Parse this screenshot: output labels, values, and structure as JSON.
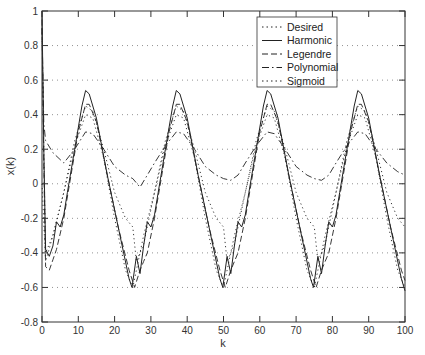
{
  "chart_data": {
    "type": "line",
    "title": "",
    "xlabel": "k",
    "ylabel": "x(k)",
    "xlim": [
      0,
      100
    ],
    "ylim": [
      -0.8,
      1
    ],
    "xticks": [
      0,
      10,
      20,
      30,
      40,
      50,
      60,
      70,
      80,
      90,
      100
    ],
    "yticks": [
      -0.8,
      -0.6,
      -0.4,
      -0.2,
      0,
      0.2,
      0.4,
      0.6,
      0.8,
      1
    ],
    "xtick_labels": [
      "0",
      "10",
      "20",
      "30",
      "40",
      "50",
      "60",
      "70",
      "80",
      "90",
      "100"
    ],
    "ytick_labels": [
      "-0.8",
      "-0.6",
      "-0.4",
      "-0.2",
      "0",
      "0.2",
      "0.4",
      "0.6",
      "0.8",
      "1"
    ],
    "grid": "horizontal dotted",
    "legend_position": "upper right",
    "legend": [
      "Desired",
      "Harmonic",
      "Legendre",
      "Polynomial",
      "Sigmoid"
    ],
    "period": 25,
    "series": [
      {
        "name": "Desired",
        "style": "dotted",
        "x": [
          0,
          1,
          3,
          6,
          9,
          12,
          14,
          17,
          20,
          23,
          25,
          26,
          28,
          31,
          34,
          37,
          39,
          42,
          45,
          48,
          50,
          51,
          53,
          56,
          59,
          62,
          64,
          67,
          70,
          73,
          75,
          76,
          78,
          81,
          84,
          87,
          89,
          92,
          95,
          98,
          100
        ],
        "values": [
          0.0,
          -0.45,
          -0.3,
          -0.05,
          0.22,
          0.4,
          0.38,
          0.15,
          -0.2,
          -0.5,
          -0.6,
          -0.5,
          -0.3,
          -0.05,
          0.22,
          0.4,
          0.38,
          0.15,
          -0.2,
          -0.5,
          -0.6,
          -0.5,
          -0.3,
          -0.05,
          0.22,
          0.4,
          0.38,
          0.15,
          -0.2,
          -0.5,
          -0.6,
          -0.5,
          -0.3,
          -0.05,
          0.22,
          0.4,
          0.38,
          0.15,
          -0.2,
          -0.5,
          -0.6
        ]
      },
      {
        "name": "Harmonic",
        "style": "solid",
        "x": [
          0,
          0.5,
          1,
          2,
          3,
          4,
          5,
          6,
          7,
          9,
          11,
          12,
          13,
          15,
          18,
          21,
          24,
          24.8,
          26,
          27,
          28,
          29,
          30,
          31,
          32,
          34,
          36,
          37,
          38,
          40,
          43,
          46,
          49,
          49.8,
          51,
          52,
          53,
          54,
          55,
          56,
          57,
          59,
          61,
          62,
          63,
          65,
          68,
          71,
          74,
          74.8,
          76,
          77,
          78,
          79,
          80,
          81,
          82,
          84,
          86,
          87,
          88,
          90,
          93,
          96,
          99,
          100
        ],
        "values": [
          1.0,
          0.2,
          -0.38,
          -0.42,
          -0.36,
          -0.22,
          -0.25,
          -0.18,
          -0.05,
          0.2,
          0.45,
          0.54,
          0.52,
          0.38,
          0.05,
          -0.25,
          -0.55,
          -0.6,
          -0.42,
          -0.52,
          -0.36,
          -0.22,
          -0.25,
          -0.18,
          -0.05,
          0.2,
          0.45,
          0.54,
          0.52,
          0.38,
          0.05,
          -0.25,
          -0.55,
          -0.6,
          -0.42,
          -0.52,
          -0.36,
          -0.22,
          -0.25,
          -0.18,
          -0.05,
          0.2,
          0.45,
          0.54,
          0.52,
          0.38,
          0.05,
          -0.25,
          -0.55,
          -0.6,
          -0.42,
          -0.52,
          -0.36,
          -0.22,
          -0.25,
          -0.18,
          -0.05,
          0.2,
          0.45,
          0.54,
          0.52,
          0.38,
          0.05,
          -0.25,
          -0.55,
          -0.62
        ]
      },
      {
        "name": "Legendre",
        "style": "dashed",
        "x": [
          0,
          0.5,
          1,
          2,
          3,
          4,
          6,
          8,
          10,
          12,
          13,
          15,
          18,
          21,
          24,
          25.5,
          27,
          28,
          29,
          31,
          33,
          35,
          37,
          38,
          40,
          43,
          46,
          49,
          50.5,
          52,
          53,
          54,
          56,
          58,
          60,
          62,
          63,
          65,
          68,
          71,
          74,
          75.5,
          77,
          78,
          79,
          81,
          83,
          85,
          87,
          88,
          90,
          93,
          96,
          99,
          100
        ],
        "values": [
          0.95,
          0.1,
          -0.48,
          -0.5,
          -0.44,
          -0.38,
          -0.2,
          0.05,
          0.3,
          0.46,
          0.46,
          0.36,
          0.05,
          -0.25,
          -0.5,
          -0.6,
          -0.5,
          -0.45,
          -0.4,
          -0.2,
          0.05,
          0.3,
          0.46,
          0.46,
          0.36,
          0.05,
          -0.25,
          -0.5,
          -0.6,
          -0.5,
          -0.45,
          -0.4,
          -0.2,
          0.05,
          0.3,
          0.46,
          0.46,
          0.36,
          0.05,
          -0.25,
          -0.5,
          -0.6,
          -0.5,
          -0.45,
          -0.4,
          -0.2,
          0.05,
          0.3,
          0.46,
          0.46,
          0.36,
          0.05,
          -0.25,
          -0.5,
          -0.56
        ]
      },
      {
        "name": "Polynomial",
        "style": "dash-dot",
        "x": [
          0,
          0.5,
          1,
          3,
          6,
          9,
          12,
          14,
          17,
          20,
          23,
          25,
          27,
          29,
          31,
          34,
          37,
          39,
          42,
          45,
          48,
          50,
          52,
          54,
          56,
          59,
          62,
          64,
          67,
          70,
          73,
          75,
          77,
          79,
          81,
          84,
          87,
          89,
          92,
          95,
          98,
          100
        ],
        "values": [
          0.9,
          0.35,
          0.25,
          0.18,
          0.12,
          0.2,
          0.3,
          0.29,
          0.2,
          0.1,
          0.05,
          0.03,
          -0.02,
          0.05,
          0.12,
          0.22,
          0.3,
          0.29,
          0.2,
          0.1,
          0.05,
          0.03,
          0.02,
          0.05,
          0.12,
          0.22,
          0.3,
          0.29,
          0.2,
          0.1,
          0.05,
          0.03,
          0.02,
          0.05,
          0.12,
          0.22,
          0.3,
          0.29,
          0.2,
          0.12,
          0.07,
          0.05
        ]
      },
      {
        "name": "Sigmoid",
        "style": "dotted",
        "x": [
          0,
          0.5,
          1,
          3,
          6,
          9,
          12,
          14,
          17,
          20,
          23,
          25,
          26,
          28,
          31,
          34,
          37,
          39,
          42,
          45,
          48,
          50,
          51,
          53,
          56,
          59,
          62,
          64,
          67,
          70,
          73,
          75,
          76,
          78,
          81,
          84,
          87,
          89,
          92,
          95,
          98,
          100
        ],
        "values": [
          0.9,
          0.2,
          -0.4,
          -0.3,
          -0.05,
          0.25,
          0.45,
          0.42,
          0.2,
          -0.05,
          -0.2,
          -0.25,
          -0.45,
          -0.35,
          -0.05,
          0.25,
          0.45,
          0.42,
          0.2,
          -0.05,
          -0.2,
          -0.25,
          -0.45,
          -0.35,
          -0.05,
          0.25,
          0.45,
          0.42,
          0.2,
          -0.05,
          -0.2,
          -0.25,
          -0.45,
          -0.35,
          -0.05,
          0.25,
          0.45,
          0.42,
          0.2,
          -0.05,
          -0.2,
          -0.25
        ]
      }
    ]
  },
  "axes": {
    "xlabel": "k",
    "ylabel": "x(k)"
  },
  "legend": {
    "items": [
      {
        "label": "Desired",
        "style": "dotted"
      },
      {
        "label": "Harmonic",
        "style": "solid"
      },
      {
        "label": "Legendre",
        "style": "dashed"
      },
      {
        "label": "Polynomial",
        "style": "dash-dot"
      },
      {
        "label": "Sigmoid",
        "style": "dotted"
      }
    ]
  },
  "colors": {
    "line": "#222222",
    "grid": "#777777",
    "frame": "#333333"
  }
}
